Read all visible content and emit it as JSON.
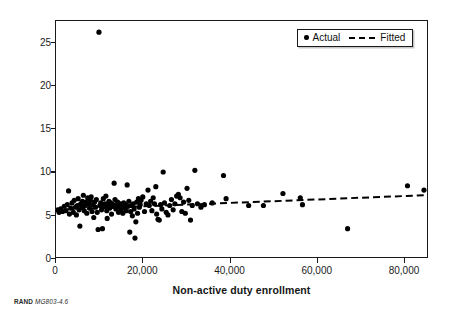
{
  "chart_data": {
    "type": "scatter",
    "title": "",
    "xlabel": "Non-active duty enrollment",
    "ylabel": "Mean inpatient utilization",
    "xlim": [
      0,
      85500
    ],
    "ylim": [
      0,
      27.5
    ],
    "xticks": [
      0,
      20000,
      40000,
      60000,
      80000
    ],
    "xtick_labels": [
      "0",
      "20,000",
      "40,000",
      "60,000",
      "80,000"
    ],
    "yticks": [
      0,
      5,
      10,
      15,
      20,
      25
    ],
    "ytick_labels": [
      "0",
      "5",
      "10",
      "15",
      "20",
      "25"
    ],
    "grid": false,
    "legend_position": "top-right",
    "marker_color": "#000000",
    "fitted_color": "#000000",
    "series": [
      {
        "name": "Actual",
        "type": "scatter",
        "points": [
          [
            400,
            5.5
          ],
          [
            700,
            5.2
          ],
          [
            1100,
            5.6
          ],
          [
            1500,
            5.3
          ],
          [
            1900,
            5.9
          ],
          [
            2300,
            5.4
          ],
          [
            2600,
            6.1
          ],
          [
            2900,
            7.7
          ],
          [
            3100,
            5.0
          ],
          [
            3400,
            5.7
          ],
          [
            3700,
            6.3
          ],
          [
            4000,
            5.2
          ],
          [
            4200,
            6.6
          ],
          [
            4500,
            5.8
          ],
          [
            4700,
            4.9
          ],
          [
            4900,
            6.0
          ],
          [
            5100,
            6.8
          ],
          [
            5300,
            5.5
          ],
          [
            5500,
            3.6
          ],
          [
            5700,
            6.2
          ],
          [
            5900,
            5.9
          ],
          [
            6100,
            6.5
          ],
          [
            6300,
            7.2
          ],
          [
            6500,
            5.4
          ],
          [
            6700,
            6.0
          ],
          [
            6900,
            6.4
          ],
          [
            7100,
            5.1
          ],
          [
            7300,
            6.9
          ],
          [
            7500,
            6.2
          ],
          [
            7700,
            5.7
          ],
          [
            7900,
            6.6
          ],
          [
            8100,
            7.0
          ],
          [
            8300,
            5.3
          ],
          [
            8500,
            6.1
          ],
          [
            8700,
            4.6
          ],
          [
            8900,
            6.4
          ],
          [
            9100,
            5.8
          ],
          [
            9300,
            6.7
          ],
          [
            9500,
            5.2
          ],
          [
            9700,
            3.2
          ],
          [
            9900,
            26.2
          ],
          [
            10100,
            6.0
          ],
          [
            10300,
            6.3
          ],
          [
            10500,
            5.5
          ],
          [
            10700,
            3.3
          ],
          [
            10900,
            6.8
          ],
          [
            11100,
            5.9
          ],
          [
            11300,
            6.2
          ],
          [
            11500,
            7.1
          ],
          [
            11700,
            5.4
          ],
          [
            11800,
            4.5
          ],
          [
            12000,
            6.0
          ],
          [
            12200,
            6.5
          ],
          [
            12400,
            5.7
          ],
          [
            12600,
            6.3
          ],
          [
            12800,
            5.0
          ],
          [
            13000,
            5.9
          ],
          [
            13200,
            6.1
          ],
          [
            13400,
            8.6
          ],
          [
            13600,
            6.7
          ],
          [
            13800,
            5.6
          ],
          [
            14000,
            6.0
          ],
          [
            14200,
            6.4
          ],
          [
            14400,
            5.2
          ],
          [
            14600,
            5.8
          ],
          [
            14800,
            6.2
          ],
          [
            15000,
            5.5
          ],
          [
            15200,
            6.0
          ],
          [
            15400,
            5.1
          ],
          [
            15600,
            6.3
          ],
          [
            15800,
            5.7
          ],
          [
            16000,
            6.1
          ],
          [
            16200,
            5.4
          ],
          [
            16400,
            8.4
          ],
          [
            16600,
            5.9
          ],
          [
            16800,
            6.5
          ],
          [
            17000,
            2.9
          ],
          [
            17200,
            5.3
          ],
          [
            17400,
            6.0
          ],
          [
            17600,
            4.8
          ],
          [
            17800,
            6.2
          ],
          [
            18000,
            5.6
          ],
          [
            18200,
            2.2
          ],
          [
            18400,
            4.1
          ],
          [
            18600,
            6.4
          ],
          [
            18800,
            5.1
          ],
          [
            19000,
            6.8
          ],
          [
            19200,
            5.8
          ],
          [
            19400,
            6.1
          ],
          [
            19600,
            6.6
          ],
          [
            20000,
            7.0
          ],
          [
            20400,
            5.3
          ],
          [
            20800,
            6.2
          ],
          [
            21200,
            7.8
          ],
          [
            21500,
            6.0
          ],
          [
            21800,
            6.5
          ],
          [
            22100,
            5.4
          ],
          [
            22400,
            6.9
          ],
          [
            22700,
            6.2
          ],
          [
            23000,
            8.2
          ],
          [
            23200,
            5.0
          ],
          [
            23500,
            4.4
          ],
          [
            23800,
            4.3
          ],
          [
            24100,
            6.1
          ],
          [
            24400,
            5.6
          ],
          [
            24700,
            9.9
          ],
          [
            25000,
            6.3
          ],
          [
            25400,
            5.2
          ],
          [
            25800,
            4.9
          ],
          [
            26200,
            6.0
          ],
          [
            26600,
            6.7
          ],
          [
            27000,
            5.5
          ],
          [
            27400,
            6.2
          ],
          [
            27800,
            7.1
          ],
          [
            28200,
            7.3
          ],
          [
            28600,
            6.9
          ],
          [
            29000,
            5.3
          ],
          [
            29400,
            6.4
          ],
          [
            29800,
            5.1
          ],
          [
            30200,
            8.0
          ],
          [
            30600,
            6.6
          ],
          [
            31000,
            4.3
          ],
          [
            31400,
            6.0
          ],
          [
            32000,
            10.1
          ],
          [
            32600,
            6.2
          ],
          [
            33400,
            5.8
          ],
          [
            34200,
            6.1
          ],
          [
            36000,
            6.3
          ],
          [
            38600,
            9.5
          ],
          [
            39200,
            6.8
          ],
          [
            44400,
            6.0
          ],
          [
            47800,
            6.0
          ],
          [
            52300,
            7.4
          ],
          [
            56300,
            6.9
          ],
          [
            56800,
            6.1
          ],
          [
            67200,
            3.3
          ],
          [
            81000,
            8.3
          ],
          [
            84800,
            7.8
          ]
        ]
      },
      {
        "name": "Fitted",
        "type": "line",
        "style": "dashed",
        "points": [
          [
            0,
            5.5
          ],
          [
            85000,
            7.2
          ]
        ]
      }
    ],
    "legend": [
      {
        "label": "Actual",
        "marker": "dot"
      },
      {
        "label": "Fitted",
        "marker": "dashed-line"
      }
    ]
  },
  "figure": {
    "source_credit_prefix": "RAND ",
    "source_credit_id": "MG803-4.6"
  }
}
